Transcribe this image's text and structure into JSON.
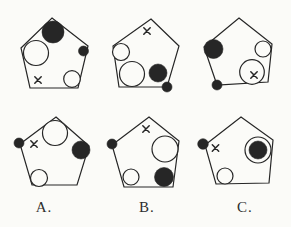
{
  "figure": {
    "paper_color": "#fbfbf8",
    "ink_color": "#262626",
    "canvas": {
      "width": 291,
      "height": 227
    },
    "cells": [
      {
        "id": "top-left",
        "pentagon": [
          [
            52,
            18
          ],
          [
            88,
            46
          ],
          [
            78,
            88
          ],
          [
            30,
            88
          ],
          [
            21,
            48
          ]
        ],
        "items": [
          {
            "shape": "circle",
            "cx": 53,
            "cy": 32,
            "r": 11,
            "fill": "ink"
          },
          {
            "shape": "circle",
            "cx": 36,
            "cy": 53,
            "r": 12.5,
            "fill": "paper"
          },
          {
            "shape": "circle",
            "cx": 83.5,
            "cy": 51,
            "r": 5,
            "fill": "ink"
          },
          {
            "shape": "circle",
            "cx": 72,
            "cy": 79,
            "r": 8.3,
            "fill": "paper"
          },
          {
            "shape": "cross",
            "x": 38,
            "y": 80,
            "size": 3.2
          }
        ]
      },
      {
        "id": "top-middle",
        "pentagon": [
          [
            151,
            19
          ],
          [
            179,
            46
          ],
          [
            167,
            87
          ],
          [
            119,
            87
          ],
          [
            113,
            46
          ]
        ],
        "items": [
          {
            "shape": "cross",
            "x": 147,
            "y": 31,
            "size": 3.2
          },
          {
            "shape": "circle",
            "cx": 121,
            "cy": 52,
            "r": 8.5,
            "fill": "paper"
          },
          {
            "shape": "circle",
            "cx": 132,
            "cy": 74,
            "r": 12.5,
            "fill": "paper"
          },
          {
            "shape": "circle",
            "cx": 158,
            "cy": 73,
            "r": 9,
            "fill": "ink"
          },
          {
            "shape": "circle",
            "cx": 167,
            "cy": 87,
            "r": 5,
            "fill": "ink"
          }
        ]
      },
      {
        "id": "top-right",
        "pentagon": [
          [
            239,
            18
          ],
          [
            272,
            44
          ],
          [
            268,
            82
          ],
          [
            217,
            85
          ],
          [
            204,
            47
          ]
        ],
        "items": [
          {
            "shape": "circle",
            "cx": 213.5,
            "cy": 49,
            "r": 9.5,
            "fill": "ink"
          },
          {
            "shape": "circle",
            "cx": 263,
            "cy": 49,
            "r": 8,
            "fill": "paper"
          },
          {
            "shape": "circle",
            "cx": 252,
            "cy": 72,
            "r": 12.3,
            "fill": "paper"
          },
          {
            "shape": "cross",
            "x": 254,
            "y": 75,
            "size": 3.2
          },
          {
            "shape": "circle",
            "cx": 217,
            "cy": 85,
            "r": 5,
            "fill": "ink"
          }
        ]
      },
      {
        "id": "bottom-left",
        "pentagon": [
          [
            56,
            117
          ],
          [
            89,
            146
          ],
          [
            77,
            185
          ],
          [
            32,
            185
          ],
          [
            20,
            144
          ]
        ],
        "items": [
          {
            "shape": "circle",
            "cx": 55,
            "cy": 133,
            "r": 12.5,
            "fill": "paper"
          },
          {
            "shape": "circle",
            "cx": 19,
            "cy": 143,
            "r": 5,
            "fill": "ink"
          },
          {
            "shape": "cross",
            "x": 34,
            "y": 144,
            "size": 3.2
          },
          {
            "shape": "circle",
            "cx": 81,
            "cy": 150,
            "r": 9,
            "fill": "ink"
          },
          {
            "shape": "circle",
            "cx": 39,
            "cy": 178,
            "r": 8.5,
            "fill": "paper"
          }
        ]
      },
      {
        "id": "bottom-middle",
        "pentagon": [
          [
            149,
            117
          ],
          [
            179,
            141
          ],
          [
            173,
            187
          ],
          [
            124,
            187
          ],
          [
            112,
            145
          ]
        ],
        "items": [
          {
            "shape": "cross",
            "x": 146,
            "y": 129,
            "size": 3.2
          },
          {
            "shape": "circle",
            "cx": 112,
            "cy": 144,
            "r": 5,
            "fill": "ink"
          },
          {
            "shape": "circle",
            "cx": 165,
            "cy": 149,
            "r": 13,
            "fill": "paper"
          },
          {
            "shape": "circle",
            "cx": 131,
            "cy": 177,
            "r": 8,
            "fill": "paper"
          },
          {
            "shape": "circle",
            "cx": 164,
            "cy": 177,
            "r": 9.5,
            "fill": "ink"
          }
        ]
      },
      {
        "id": "bottom-right",
        "pentagon": [
          [
            241,
            117
          ],
          [
            273,
            140
          ],
          [
            269,
            183
          ],
          [
            216,
            184
          ],
          [
            205,
            145
          ]
        ],
        "items": [
          {
            "shape": "circle",
            "cx": 203,
            "cy": 144,
            "r": 5.3,
            "fill": "ink"
          },
          {
            "shape": "cross",
            "x": 215.5,
            "y": 148,
            "size": 3.2
          },
          {
            "shape": "circle",
            "cx": 258,
            "cy": 150,
            "r": 13,
            "fill": "paper"
          },
          {
            "shape": "circle",
            "cx": 258,
            "cy": 150,
            "r": 9,
            "fill": "ink"
          },
          {
            "shape": "circle",
            "cx": 225,
            "cy": 176,
            "r": 8,
            "fill": "paper"
          }
        ]
      }
    ],
    "labels": [
      {
        "text": "A.",
        "x": 44
      },
      {
        "text": "B.",
        "x": 147
      },
      {
        "text": "C.",
        "x": 245
      }
    ]
  }
}
